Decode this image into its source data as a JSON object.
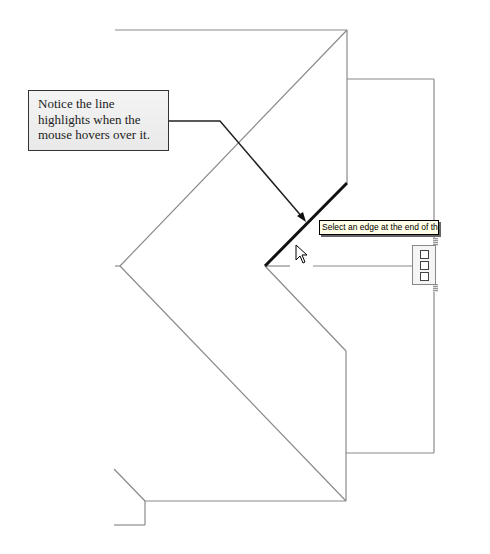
{
  "callout": {
    "lines": [
      "Notice the line",
      "highlights when the",
      "mouse hovers over it."
    ]
  },
  "tooltip": {
    "text": "Select an edge at the end of the roof tha"
  },
  "drawing": {
    "line_color": "#888888",
    "highlight_color": "#111111",
    "leader_color": "#222222"
  },
  "icons": {
    "cursor": "mouse-pointer-icon",
    "grip": "edge-grip-handle"
  }
}
